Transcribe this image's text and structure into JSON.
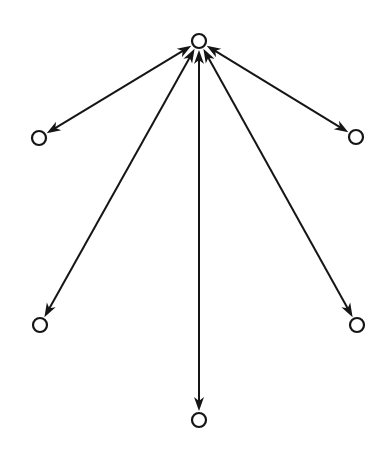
{
  "diagram": {
    "type": "directed-graph",
    "layout": "star",
    "colors": {
      "stroke": "#151515",
      "node_fill": "#ffffff",
      "background": "#ffffff"
    },
    "node_radius": 8,
    "nodes": [
      {
        "id": "hub",
        "x": 199,
        "y": 41
      },
      {
        "id": "upper-left",
        "x": 39,
        "y": 138
      },
      {
        "id": "upper-right",
        "x": 356,
        "y": 137
      },
      {
        "id": "lower-left",
        "x": 40,
        "y": 325
      },
      {
        "id": "lower-right",
        "x": 357,
        "y": 325
      },
      {
        "id": "bottom",
        "x": 199,
        "y": 420
      }
    ],
    "edges": [
      {
        "from": "hub",
        "to": "upper-left",
        "bidirectional": true
      },
      {
        "from": "hub",
        "to": "upper-right",
        "bidirectional": true
      },
      {
        "from": "hub",
        "to": "lower-left",
        "bidirectional": true
      },
      {
        "from": "hub",
        "to": "lower-right",
        "bidirectional": true
      },
      {
        "from": "hub",
        "to": "bottom",
        "bidirectional": true
      }
    ]
  }
}
